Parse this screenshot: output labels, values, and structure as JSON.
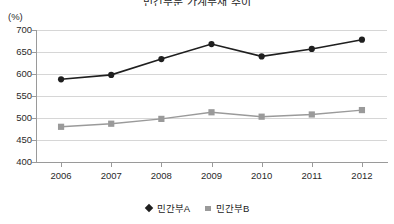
{
  "chart_data": {
    "type": "line",
    "title": "민간부문 가계부채 추이",
    "unit_label": "(%)",
    "xlabel": "",
    "ylabel": "",
    "ylim": [
      400,
      700
    ],
    "ytick_step": 50,
    "yticks": [
      700,
      650,
      600,
      550,
      500,
      450,
      400
    ],
    "ytick_labels": [
      "700",
      "650",
      "600",
      "550",
      "500",
      "450",
      "400"
    ],
    "grid": true,
    "legend_position": "bottom",
    "categories": [
      2006,
      2007,
      2008,
      2009,
      2010,
      2011,
      2012
    ],
    "xtick_labels": [
      "2006",
      "2007",
      "2008",
      "2009",
      "2010",
      "2011",
      "2012"
    ],
    "series": [
      {
        "name": "민간부A",
        "marker": "diamond",
        "color": "#1f1f1f",
        "values": [
          588,
          598,
          634,
          668,
          640,
          657,
          678
        ]
      },
      {
        "name": "민간부B",
        "marker": "square",
        "color": "#9a9a9a",
        "values": [
          480,
          487,
          498,
          513,
          503,
          508,
          518
        ]
      }
    ]
  },
  "legend": {
    "entries": [
      {
        "label": "민간부A"
      },
      {
        "label": "민간부B"
      }
    ]
  },
  "colors": {
    "series_a": "#1f1f1f",
    "series_b": "#9a9a9a",
    "gridline": "#d6d6d6",
    "axis": "#9a9a9a",
    "background": "#ffffff"
  }
}
